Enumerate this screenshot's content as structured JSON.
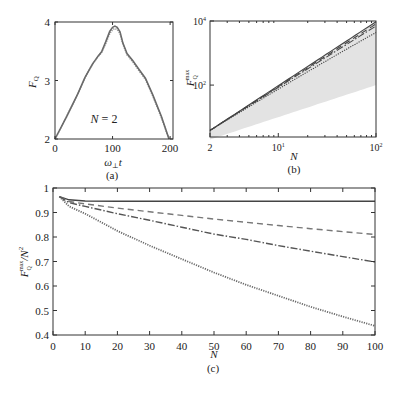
{
  "chart_data": [
    {
      "id": "a",
      "type": "line",
      "caption": "(a)",
      "xlabel": "ω⊥t",
      "ylabel": "F_Q",
      "xlim": [
        0,
        205
      ],
      "ylim": [
        2,
        4
      ],
      "xticks": [
        0,
        100,
        200
      ],
      "yticks": [
        2,
        3,
        4
      ],
      "annotation": "N = 2",
      "grid": false,
      "series": [
        {
          "name": "F_Q(t)",
          "style": "solid",
          "color": "#6a6a6a",
          "x": [
            0,
            20,
            40,
            52,
            65,
            75,
            81,
            88,
            95,
            100,
            104,
            108,
            113,
            118,
            125,
            135,
            145,
            157,
            170,
            185,
            198
          ],
          "y": [
            2.0,
            2.38,
            2.78,
            3.05,
            3.28,
            3.42,
            3.49,
            3.66,
            3.84,
            3.91,
            3.93,
            3.91,
            3.83,
            3.64,
            3.46,
            3.34,
            3.2,
            3.04,
            2.75,
            2.38,
            2.0
          ]
        },
        {
          "name": "F_Q(t) alt",
          "style": "dotted",
          "color": "#999999",
          "x": [
            0,
            20,
            40,
            52,
            65,
            75,
            81,
            88,
            95,
            100,
            104,
            108,
            113,
            118,
            125,
            135,
            145,
            157,
            170,
            185,
            198
          ],
          "y": [
            2.0,
            2.38,
            2.78,
            3.05,
            3.27,
            3.41,
            3.48,
            3.63,
            3.8,
            3.87,
            3.89,
            3.87,
            3.8,
            3.62,
            3.44,
            3.32,
            3.18,
            3.02,
            2.73,
            2.36,
            2.0
          ]
        }
      ]
    },
    {
      "id": "b",
      "type": "line",
      "caption": "(b)",
      "xlabel": "N",
      "ylabel": "F_Q^max",
      "xscale": "log",
      "yscale": "log",
      "xlim": [
        2,
        100
      ],
      "ylim": [
        2.4,
        10000
      ],
      "xticks": [
        {
          "v": 2,
          "label": "2"
        },
        {
          "v": 10,
          "label": "10",
          "exp": "1"
        },
        {
          "v": 100,
          "label": "10",
          "exp": "2"
        }
      ],
      "yticks": [
        {
          "v": 100,
          "label": "10",
          "exp": "2"
        },
        {
          "v": 10000,
          "label": "10",
          "exp": "4"
        }
      ],
      "shaded_band": {
        "lower": "N",
        "upper": "N^2",
        "color": "#e3e3e3"
      },
      "series": [
        {
          "name": "solid",
          "style": "solid",
          "ratio_at_2": 0.965,
          "ratio_at_100": 0.947
        },
        {
          "name": "dashed",
          "style": "dashed",
          "ratio_at_2": 0.965,
          "ratio_at_100": 0.81
        },
        {
          "name": "dash-dot",
          "style": "dashdot",
          "ratio_at_2": 0.965,
          "ratio_at_100": 0.698
        },
        {
          "name": "dotted",
          "style": "dotted",
          "ratio_at_2": 0.965,
          "ratio_at_100": 0.437
        }
      ]
    },
    {
      "id": "c",
      "type": "line",
      "caption": "(c)",
      "xlabel": "N",
      "ylabel": "F_Q^max / N^2",
      "xlim": [
        0,
        100
      ],
      "ylim": [
        0.4,
        1.0
      ],
      "xticks": [
        0,
        10,
        20,
        30,
        40,
        50,
        60,
        70,
        80,
        90,
        100
      ],
      "yticks": [
        0.4,
        0.5,
        0.6,
        0.7,
        0.8,
        0.9,
        1
      ],
      "ytick_labels": [
        "0.4",
        "0.5",
        "0.6",
        "0.7",
        "0.8",
        "0.9",
        "1"
      ],
      "grid": false,
      "x": [
        2,
        5,
        10,
        20,
        30,
        40,
        50,
        60,
        70,
        80,
        90,
        100
      ],
      "series": [
        {
          "name": "solid",
          "style": "solid",
          "color": "#444444",
          "values": [
            0.965,
            0.952,
            0.947,
            0.946,
            0.946,
            0.946,
            0.946,
            0.946,
            0.946,
            0.946,
            0.946,
            0.946
          ]
        },
        {
          "name": "dashed",
          "style": "dashed",
          "color": "#777777",
          "values": [
            0.965,
            0.945,
            0.935,
            0.918,
            0.903,
            0.888,
            0.873,
            0.86,
            0.847,
            0.834,
            0.822,
            0.81
          ]
        },
        {
          "name": "dash-dot",
          "style": "dashdot",
          "color": "#555555",
          "values": [
            0.965,
            0.94,
            0.925,
            0.895,
            0.868,
            0.84,
            0.812,
            0.79,
            0.765,
            0.742,
            0.72,
            0.698
          ]
        },
        {
          "name": "dotted",
          "style": "dotted",
          "color": "#6a6a6a",
          "values": [
            0.965,
            0.925,
            0.895,
            0.825,
            0.765,
            0.71,
            0.655,
            0.605,
            0.56,
            0.515,
            0.475,
            0.437
          ]
        }
      ]
    }
  ],
  "labels": {
    "a_caption": "(a)",
    "b_caption": "(b)",
    "c_caption": "(c)",
    "a_annotation_N": "N",
    "a_annotation_rest": " = 2",
    "a_xlabel_main": "ω",
    "a_xlabel_sub": "⊥",
    "a_xlabel_t": "t",
    "a_ylabel_main": "F",
    "a_ylabel_sub": "Q",
    "b_xlabel": "N",
    "b_ylabel_main": "F",
    "b_ylabel_sub": "Q",
    "b_ylabel_sup": "max",
    "c_xlabel": "N",
    "c_ylabel_main": "F",
    "c_ylabel_sub": "Q",
    "c_ylabel_sup": "max",
    "c_ylabel_rest": "/N",
    "c_ylabel_exp": "2"
  }
}
